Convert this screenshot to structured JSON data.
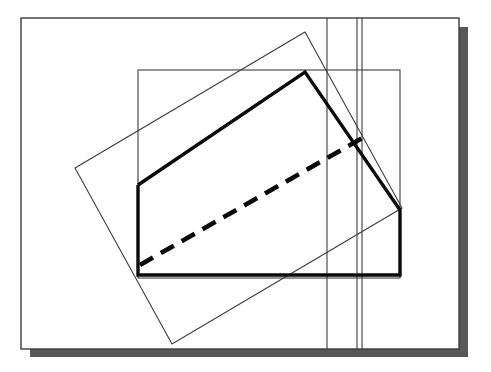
{
  "figure": {
    "canvas": {
      "width": 491,
      "height": 372,
      "background": "#ffffff"
    },
    "colors": {
      "thin_stroke": "#3c3c3c",
      "thick_stroke": "#0a0a0a",
      "shadow": "#585858",
      "background": "#ffffff"
    },
    "stroke_widths": {
      "thin": 1.1,
      "medium": 1.4,
      "thick": 3.4,
      "dashed": 4.6
    },
    "shapes": [
      {
        "name": "drop-shadow",
        "kind": "polygon",
        "role": "shadow",
        "fill": "#585858",
        "points": "30,357 468,357 468,27 459,27 459,349 30,349"
      },
      {
        "name": "outer-page-rectangle",
        "kind": "rect",
        "role": "axis-aligned-outline",
        "stroke": "#3c3c3c",
        "stroke_width": 1.4,
        "x": 21,
        "y": 18,
        "width": 438,
        "height": 331
      },
      {
        "name": "inner-axis-aligned-rectangle",
        "kind": "rect",
        "role": "axis-aligned-outline",
        "stroke": "#3c3c3c",
        "stroke_width": 1.1,
        "x": 138,
        "y": 70,
        "width": 262,
        "height": 208
      },
      {
        "name": "tilted-rectangle",
        "kind": "polygon",
        "role": "rotated-outline",
        "stroke": "#3c3c3c",
        "stroke_width": 1.1,
        "points": "305,32 75,168 172,344 402,208"
      },
      {
        "name": "vertical-line-left",
        "kind": "line",
        "role": "guide-line",
        "stroke": "#3c3c3c",
        "stroke_width": 1.1,
        "x1": 327,
        "y1": 18,
        "x2": 327,
        "y2": 349
      },
      {
        "name": "vertical-line-middle",
        "kind": "line",
        "role": "guide-line",
        "stroke": "#3c3c3c",
        "stroke_width": 1.1,
        "x1": 357,
        "y1": 18,
        "x2": 357,
        "y2": 349
      },
      {
        "name": "vertical-line-right",
        "kind": "line",
        "role": "guide-line",
        "stroke": "#3c3c3c",
        "stroke_width": 1.1,
        "x1": 362,
        "y1": 18,
        "x2": 362,
        "y2": 349
      },
      {
        "name": "thick-pentagon-outline",
        "kind": "polyline",
        "role": "primary-emphasis-shape",
        "stroke": "#0a0a0a",
        "stroke_width": 3.4,
        "points": "138,185 305,72 400,210 400,275 138,275 138,185"
      },
      {
        "name": "dashed-diagonal",
        "kind": "line",
        "role": "hidden-edge",
        "stroke": "#0a0a0a",
        "stroke_width": 4.6,
        "dash_pattern": "15 9",
        "x1": 140,
        "y1": 265,
        "x2": 364,
        "y2": 137
      }
    ],
    "vertices": [
      {
        "name": "pentagon-left-upper",
        "x": 138,
        "y": 185
      },
      {
        "name": "pentagon-apex",
        "x": 305,
        "y": 72
      },
      {
        "name": "pentagon-right-upper",
        "x": 400,
        "y": 210
      },
      {
        "name": "pentagon-right-lower",
        "x": 400,
        "y": 275
      },
      {
        "name": "pentagon-left-lower",
        "x": 138,
        "y": 275
      },
      {
        "name": "tilted-top",
        "x": 305,
        "y": 32
      },
      {
        "name": "tilted-left",
        "x": 75,
        "y": 168
      },
      {
        "name": "tilted-bottom",
        "x": 172,
        "y": 344
      },
      {
        "name": "tilted-right",
        "x": 402,
        "y": 208
      }
    ]
  }
}
